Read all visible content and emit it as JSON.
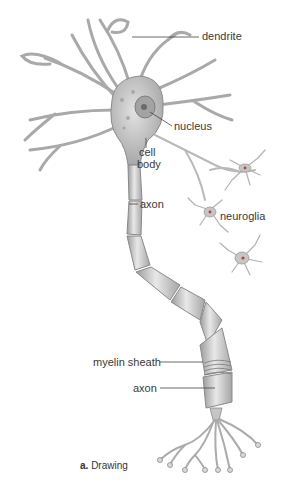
{
  "figure": {
    "type": "neuron-diagram",
    "caption": {
      "letter": "a.",
      "text": "Drawing"
    },
    "labels": {
      "dendrite": "dendrite",
      "nucleus": "nucleus",
      "cell_body_line1": "cell",
      "cell_body_line2": "body",
      "axon_upper": "axon",
      "neuroglia": "neuroglia",
      "myelin_sheath": "myelin sheath",
      "axon_lower": "axon"
    },
    "colors": {
      "neuron_fill": "#c9c9c9",
      "neuron_stroke": "#8a8a8a",
      "nucleus_fill": "#9e9e9e",
      "leader_line": "#444444",
      "glia_fill": "#b5b5b5",
      "glia_nucleus": "#c0392b"
    }
  }
}
